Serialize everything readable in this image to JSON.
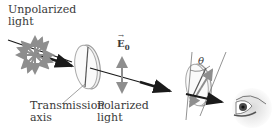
{
  "figure": {
    "labels": {
      "unpolarized_line1": "Unpolarized",
      "unpolarized_line2": "light",
      "e_field": "E",
      "e_field_subscript": "0",
      "e_field_arrow": "→",
      "transmission_line1": "Transmission",
      "transmission_line2": "axis",
      "polarized_line1": "Polarized",
      "polarized_line2": "light",
      "angle": "θ"
    },
    "colors": {
      "beam": "#1a1a1a",
      "field_arrows": "#8e8e8e",
      "polarizer_edge": "#9a9a9a",
      "polarizer_fill": "#f1f1f1",
      "text": "#3a3a3a"
    }
  }
}
